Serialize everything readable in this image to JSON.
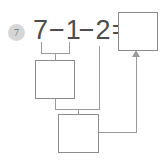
{
  "problem": {
    "number": "7",
    "equation": {
      "full_text": "7−1−2=",
      "operand_1": "7",
      "operator_1": "−",
      "operand_2": "1",
      "operator_2": "−",
      "operand_3": "2",
      "equals": "="
    },
    "answer_boxes": [
      {
        "id": "box-step1",
        "value": "",
        "label": "first-step-answer-box"
      },
      {
        "id": "box-step2",
        "value": "",
        "label": "second-step-answer-box"
      },
      {
        "id": "box-result",
        "value": "",
        "label": "final-answer-box"
      }
    ],
    "connectors": [
      {
        "name": "bracket-7-minus-1",
        "from": "7−1",
        "to": "first-step-answer-box"
      },
      {
        "name": "bracket-step1-minus-2",
        "from": "first-step-answer-box and 2",
        "to": "second-step-answer-box"
      },
      {
        "name": "arrow-to-result",
        "from": "second-step-answer-box",
        "to": "final-answer-box"
      }
    ]
  },
  "colors": {
    "badge_background": "#d6d6d6",
    "badge_text": "#6f6f6f",
    "equation_text": "#4d4d4d",
    "box_border": "#8a8a8a",
    "connector": "#9a9a9a",
    "page_background": "#ffffff"
  }
}
